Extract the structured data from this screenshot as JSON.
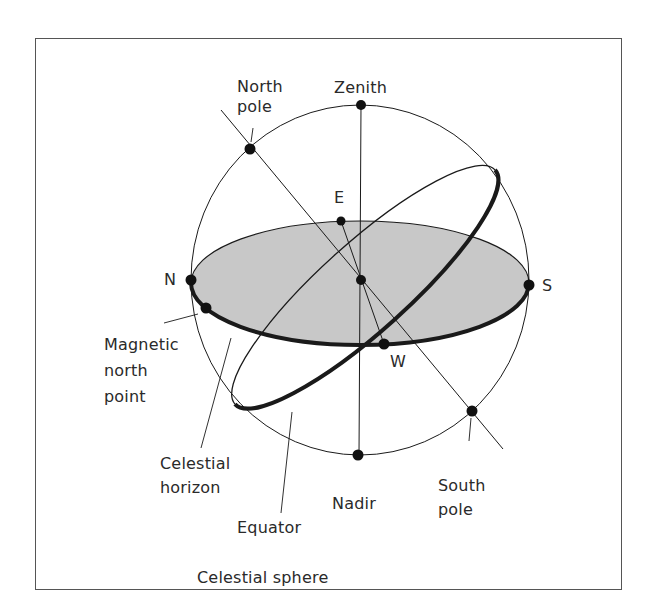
{
  "figure": {
    "caption": "Celestial sphere",
    "colors": {
      "stroke": "#1a1a1a",
      "horizon_fill": "#c8c8c8",
      "frame": "#555555",
      "text": "#2a2a2a"
    }
  },
  "labels": {
    "north_pole": "North\npole",
    "zenith": "Zenith",
    "east": "E",
    "north": "N",
    "south": "S",
    "west": "W",
    "magnetic_north_point": "Magnetic\nnorth\npoint",
    "celestial_horizon": "Celestial\nhorizon",
    "equator": "Equator",
    "nadir": "Nadir",
    "south_pole": "South\npole",
    "caption": "Celestial sphere"
  },
  "points": [
    {
      "name": "zenith",
      "x": 361,
      "y": 105
    },
    {
      "name": "north-pole",
      "x": 250,
      "y": 149
    },
    {
      "name": "east",
      "x": 341,
      "y": 221
    },
    {
      "name": "north",
      "x": 191,
      "y": 280
    },
    {
      "name": "center",
      "x": 361,
      "y": 280
    },
    {
      "name": "south",
      "x": 529,
      "y": 285
    },
    {
      "name": "magnetic-north",
      "x": 206,
      "y": 308
    },
    {
      "name": "west",
      "x": 384,
      "y": 344
    },
    {
      "name": "south-pole",
      "x": 472,
      "y": 411
    },
    {
      "name": "nadir",
      "x": 358,
      "y": 455
    }
  ]
}
